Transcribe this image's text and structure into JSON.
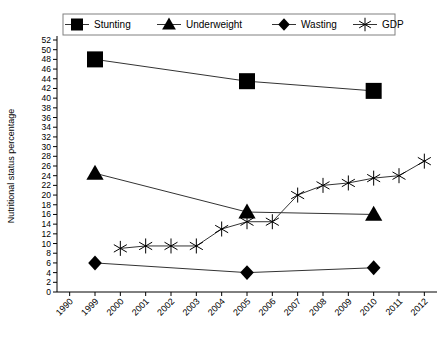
{
  "chart_data": {
    "type": "scatter",
    "title": "",
    "xlabel": "",
    "ylabel": "Nutritional status percentage",
    "categories": [
      "1990",
      "1999",
      "2000",
      "2001",
      "2002",
      "2003",
      "2004",
      "2005",
      "2006",
      "2007",
      "2008",
      "2009",
      "2010",
      "2011",
      "2012"
    ],
    "ylim": [
      0,
      52
    ],
    "ytick_step": 2,
    "yticks": [
      "0",
      "2",
      "4",
      "6",
      "8",
      "10",
      "12",
      "14",
      "16",
      "18",
      "20",
      "22",
      "24",
      "26",
      "28",
      "30",
      "32",
      "34",
      "36",
      "38",
      "40",
      "42",
      "44",
      "46",
      "48",
      "50",
      "52"
    ],
    "grid": false,
    "legend_position": "top",
    "series": [
      {
        "name": "Stunting",
        "marker": "square",
        "values": [
          null,
          48,
          null,
          null,
          null,
          null,
          null,
          43.5,
          null,
          null,
          null,
          null,
          41.5,
          null,
          null
        ]
      },
      {
        "name": "Underweight",
        "marker": "triangle",
        "values": [
          null,
          24.5,
          null,
          null,
          null,
          null,
          null,
          16.5,
          null,
          null,
          null,
          null,
          16,
          null,
          null
        ]
      },
      {
        "name": "Wasting",
        "marker": "diamond",
        "values": [
          null,
          6,
          null,
          null,
          null,
          null,
          null,
          4,
          null,
          null,
          null,
          null,
          5,
          null,
          null
        ]
      },
      {
        "name": "GDP",
        "marker": "asterisk",
        "values": [
          null,
          null,
          9,
          9.5,
          9.5,
          9.5,
          13,
          14.5,
          14.5,
          20,
          22,
          22.5,
          23.5,
          24,
          27
        ]
      }
    ]
  },
  "legend": {
    "items": [
      {
        "label": "Stunting",
        "marker": "square"
      },
      {
        "label": "Underweight",
        "marker": "triangle"
      },
      {
        "label": "Wasting",
        "marker": "diamond"
      },
      {
        "label": "GDP",
        "marker": "asterisk"
      }
    ]
  },
  "colors": {
    "marker": "#000000",
    "line": "#333333",
    "axis": "#000000",
    "legend_border": "#808080",
    "background": "#ffffff"
  }
}
